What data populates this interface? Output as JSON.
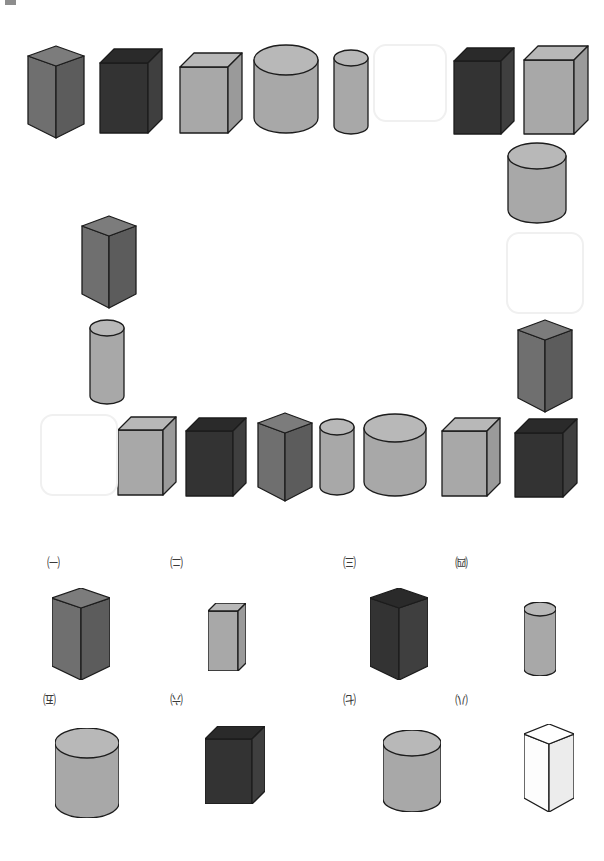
{
  "page": {
    "background": "#ffffff",
    "width": 604,
    "height": 861,
    "corner_mark_color": "#8d8d8d"
  },
  "palette": {
    "gray_mid": "#6f6f6f",
    "gray_mid_light": "#7c7c7c",
    "gray_mid_dark": "#5c5c5c",
    "dark": "#333333",
    "dark_top": "#2a2a2a",
    "dark_side": "#3f3f3f",
    "light": "#a8a8a8",
    "light_top": "#b8b8b8",
    "light_side": "#9a9a9a",
    "white_face": "#fdfdfd",
    "outline": "#1c1c1c",
    "blank_border": "#f0f0f0"
  },
  "sequence": {
    "name": "solid-sequence-loop",
    "slots": [
      {
        "id": "s1",
        "kind": "triangular-prism",
        "tone": "gray_mid",
        "x": 28,
        "y": 46,
        "w": 56,
        "h": 92
      },
      {
        "id": "s2",
        "kind": "rectangular-prism",
        "tone": "dark",
        "x": 100,
        "y": 49,
        "w": 62,
        "h": 84
      },
      {
        "id": "s3",
        "kind": "rectangular-prism",
        "tone": "light",
        "x": 180,
        "y": 53,
        "w": 62,
        "h": 80
      },
      {
        "id": "s4",
        "kind": "cylinder",
        "tone": "light",
        "x": 254,
        "y": 45,
        "w": 64,
        "h": 88
      },
      {
        "id": "s5",
        "kind": "cylinder",
        "tone": "light",
        "x": 334,
        "y": 50,
        "w": 34,
        "h": 84
      },
      {
        "id": "s6",
        "kind": "blank",
        "tone": "none",
        "x": 373,
        "y": 44,
        "w": 70,
        "h": 74
      },
      {
        "id": "s7",
        "kind": "rectangular-prism",
        "tone": "dark",
        "x": 454,
        "y": 48,
        "w": 60,
        "h": 86
      },
      {
        "id": "s8",
        "kind": "rectangular-prism",
        "tone": "light",
        "x": 524,
        "y": 46,
        "w": 64,
        "h": 88
      },
      {
        "id": "s9",
        "kind": "cylinder",
        "tone": "light",
        "x": 508,
        "y": 143,
        "w": 58,
        "h": 80
      },
      {
        "id": "s10",
        "kind": "blank",
        "tone": "none",
        "x": 506,
        "y": 232,
        "w": 74,
        "h": 78
      },
      {
        "id": "s11",
        "kind": "triangular-prism",
        "tone": "gray_mid",
        "x": 518,
        "y": 320,
        "w": 54,
        "h": 92
      },
      {
        "id": "s12",
        "kind": "rectangular-prism",
        "tone": "dark",
        "x": 515,
        "y": 419,
        "w": 62,
        "h": 78
      },
      {
        "id": "s13",
        "kind": "rectangular-prism",
        "tone": "light",
        "x": 442,
        "y": 418,
        "w": 58,
        "h": 78
      },
      {
        "id": "s14",
        "kind": "cylinder",
        "tone": "light",
        "x": 364,
        "y": 414,
        "w": 62,
        "h": 82
      },
      {
        "id": "s15",
        "kind": "cylinder",
        "tone": "light",
        "x": 320,
        "y": 419,
        "w": 34,
        "h": 76
      },
      {
        "id": "s16",
        "kind": "triangular-prism",
        "tone": "gray_mid",
        "x": 258,
        "y": 413,
        "w": 54,
        "h": 88
      },
      {
        "id": "s17",
        "kind": "rectangular-prism",
        "tone": "dark",
        "x": 186,
        "y": 418,
        "w": 60,
        "h": 78
      },
      {
        "id": "s18",
        "kind": "rectangular-prism",
        "tone": "light",
        "x": 118,
        "y": 417,
        "w": 58,
        "h": 78
      },
      {
        "id": "s19",
        "kind": "blank",
        "tone": "none",
        "x": 40,
        "y": 414,
        "w": 74,
        "h": 78
      },
      {
        "id": "s20",
        "kind": "cylinder",
        "tone": "light",
        "x": 90,
        "y": 320,
        "w": 34,
        "h": 84
      },
      {
        "id": "s21",
        "kind": "triangular-prism",
        "tone": "gray_mid",
        "x": 82,
        "y": 216,
        "w": 54,
        "h": 92
      }
    ]
  },
  "options": {
    "name": "answer-options",
    "items": [
      {
        "label": "㈠",
        "kind": "triangular-prism",
        "tone": "gray_mid",
        "lx": 47,
        "ly": 556,
        "sx": 52,
        "sy": 588,
        "w": 58,
        "h": 92
      },
      {
        "label": "㈡",
        "kind": "rectangular-prism",
        "tone": "light",
        "lx": 170,
        "ly": 556,
        "sx": 208,
        "sy": 603,
        "w": 38,
        "h": 68
      },
      {
        "label": "㈢",
        "kind": "triangular-prism",
        "tone": "dark",
        "lx": 343,
        "ly": 556,
        "sx": 370,
        "sy": 588,
        "w": 58,
        "h": 92
      },
      {
        "label": "㈣",
        "kind": "cylinder",
        "tone": "light",
        "lx": 455,
        "ly": 556,
        "sx": 524,
        "sy": 602,
        "w": 32,
        "h": 74
      },
      {
        "label": "㈤",
        "kind": "cylinder",
        "tone": "light",
        "lx": 43,
        "ly": 693,
        "sx": 55,
        "sy": 728,
        "w": 64,
        "h": 90
      },
      {
        "label": "㈥",
        "kind": "rectangular-prism",
        "tone": "dark",
        "lx": 170,
        "ly": 693,
        "sx": 205,
        "sy": 726,
        "w": 60,
        "h": 78
      },
      {
        "label": "㈦",
        "kind": "cylinder",
        "tone": "light",
        "lx": 343,
        "ly": 693,
        "sx": 383,
        "sy": 730,
        "w": 58,
        "h": 82
      },
      {
        "label": "㈧",
        "kind": "triangular-prism",
        "tone": "white",
        "lx": 455,
        "ly": 693,
        "sx": 524,
        "sy": 724,
        "w": 50,
        "h": 88
      }
    ]
  }
}
